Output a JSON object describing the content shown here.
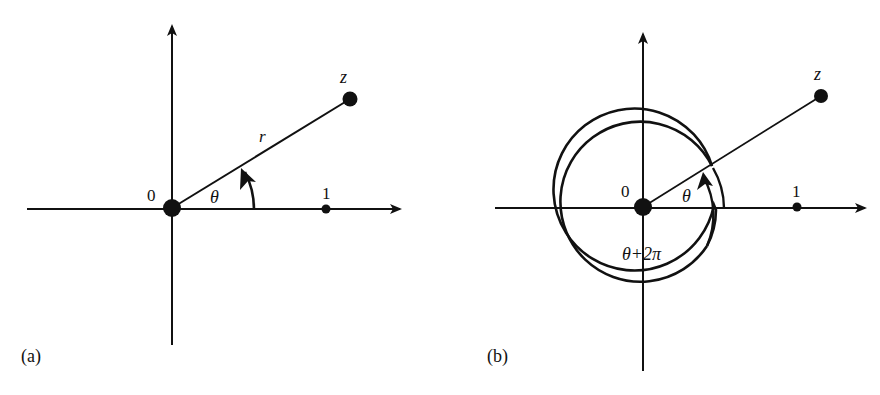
{
  "panels": [
    {
      "id": "a",
      "caption": "(a)",
      "origin_label": "0",
      "unit_label": "1",
      "point_label": "z",
      "radius_label": "r",
      "angle_label": "θ"
    },
    {
      "id": "b",
      "caption": "(b)",
      "origin_label": "0",
      "unit_label": "1",
      "point_label": "z",
      "angle_label": "θ",
      "full_angle_label": "θ+2π"
    }
  ],
  "colors": {
    "ink": "#111111",
    "background": "#ffffff"
  }
}
